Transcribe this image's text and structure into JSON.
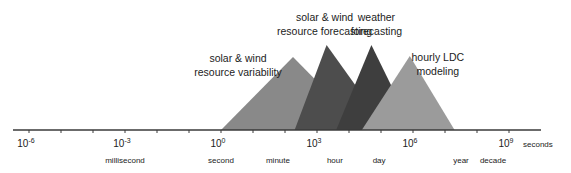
{
  "chart_data": {
    "type": "diagram",
    "title": "",
    "axis": {
      "scale": "log10",
      "unit_label": "seconds",
      "range_exponent": [
        -6.5,
        10
      ],
      "major_ticks": [
        {
          "exponent": -6,
          "label_base": "10",
          "label_exp": "-6"
        },
        {
          "exponent": -3,
          "label_base": "10",
          "label_exp": "-3"
        },
        {
          "exponent": 0,
          "label_base": "10",
          "label_exp": "0"
        },
        {
          "exponent": 3,
          "label_base": "10",
          "label_exp": "3"
        },
        {
          "exponent": 6,
          "label_base": "10",
          "label_exp": "6"
        },
        {
          "exponent": 9,
          "label_base": "10",
          "label_exp": "9"
        }
      ],
      "minor_tick_exponents": [
        -5,
        -4,
        -2,
        -1,
        1,
        2,
        4,
        5,
        7,
        8
      ],
      "time_labels": [
        {
          "label": "millisecond",
          "exponent": -3
        },
        {
          "label": "second",
          "exponent": 0
        },
        {
          "label": "minute",
          "exponent": 1.78
        },
        {
          "label": "hour",
          "exponent": 3.56
        },
        {
          "label": "day",
          "exponent": 4.94
        },
        {
          "label": "year",
          "exponent": 7.5
        },
        {
          "label": "decade",
          "exponent": 8.5
        }
      ]
    },
    "triangles": [
      {
        "name": "solar & wind resource variability",
        "lines": [
          "solar & wind",
          "resource variability"
        ],
        "start_exp": 0,
        "peak_exp": 2.25,
        "end_exp": 4.5,
        "height": 0.86,
        "color": "#898989"
      },
      {
        "name": "solar & wind resource forecasting",
        "lines": [
          "solar & wind",
          "resource forecasting"
        ],
        "start_exp": 2.3,
        "peak_exp": 3.3,
        "end_exp": 5.2,
        "height": 1.0,
        "color": "#4d4d4d"
      },
      {
        "name": "weather forecasting",
        "lines": [
          "weather",
          "forecasting"
        ],
        "start_exp": 3.6,
        "peak_exp": 4.7,
        "end_exp": 6.0,
        "height": 1.0,
        "color": "#3e3e3e"
      },
      {
        "name": "hourly LDC modeling",
        "lines": [
          "hourly LDC",
          "modeling"
        ],
        "start_exp": 4.4,
        "peak_exp": 5.9,
        "end_exp": 7.3,
        "height": 0.87,
        "color": "#9b9b9b"
      }
    ]
  }
}
